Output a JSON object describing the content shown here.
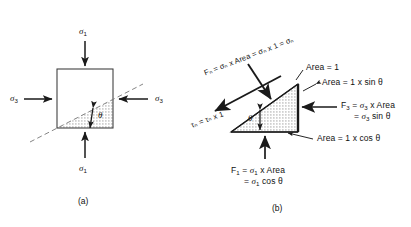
{
  "figure": {
    "panels": [
      {
        "id": "a",
        "caption": "(a)",
        "labels": {
          "sigma1_top": "σ",
          "sigma1_top_sub": "1",
          "sigma1_bottom": "σ",
          "sigma1_bottom_sub": "1",
          "sigma3_left": "σ",
          "sigma3_left_sub": "3",
          "sigma3_right": "σ",
          "sigma3_right_sub": "3",
          "theta": "θ"
        }
      },
      {
        "id": "b",
        "caption": "(b)",
        "labels": {
          "fn_line": "Fₙ = σₙ x Area = σₙ x 1 = σₙ",
          "fn_prefix": "F",
          "fn_sub": "n",
          "fn_rest": " = σ",
          "tau_line": "τₙ = τₙ x 1",
          "tau_prefix": "τ",
          "tau_sub": "n",
          "area_top": "Area = 1",
          "area_hyp": "Area = 1 x sin θ",
          "area_base": "Area = 1 x cos θ",
          "f3_line1": "F",
          "f3_sub": "3",
          "f3_line1_rest": " = σ",
          "f3_line1_tail": " x Area",
          "f3_line2": "= σ",
          "f3_line2_tail": " sin θ",
          "f1_line1": "F",
          "f1_sub": "1",
          "f1_line1_rest": " = σ",
          "f1_line1_tail": " x Area",
          "f1_line2": "= σ",
          "f1_line2_tail": " cos θ",
          "theta": "θ"
        }
      }
    ],
    "colors": {
      "stroke": "#1a1a1a",
      "hatch_fill": "#d8d8d8",
      "dashed": "#6f6f6f",
      "background": "#ffffff"
    }
  },
  "text": {
    "sigma": "σ",
    "tau": "τ",
    "theta": "θ",
    "sub_1": "1",
    "sub_3": "3",
    "sub_n": "n",
    "eq_area": "x Area",
    "eq_times1": "x 1",
    "area_eq": "Area = 1",
    "area_sin": "Area = 1 x sin θ",
    "area_cos": "Area = 1 x cos θ",
    "sin_theta": "sin θ",
    "cos_theta": "cos θ",
    "caption_a": "(a)",
    "caption_b": "(b)",
    "equals": "=",
    "F": "F",
    "fn_full": "Fₙ = σₙ x Area = σₙ x 1 = σₙ",
    "tau_full": "τₙ = τₙ x 1"
  }
}
